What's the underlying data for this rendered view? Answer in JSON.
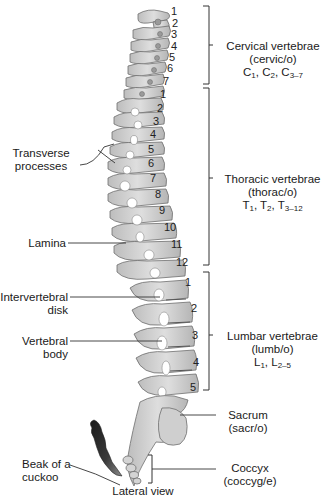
{
  "diagram": {
    "type": "anatomical-illustration",
    "caption": "Lateral view",
    "colors": {
      "bone_fill": "#c9c9c9",
      "bone_light": "#dcdcdc",
      "bone_stroke": "#6e6e6e",
      "line": "#333333",
      "beak": "#2a2a2a"
    },
    "regions": [
      {
        "id": "cervical",
        "name": "Cervical vertebrae",
        "combining_form": "(cervic/o)",
        "notation_prefix": "C",
        "notation": [
          {
            "base": "C",
            "sub": "1"
          },
          {
            "base": "C",
            "sub": "2"
          },
          {
            "base": "C",
            "sub": "3–7"
          }
        ],
        "numbers": [
          "1",
          "2",
          "3",
          "4",
          "5",
          "6",
          "7"
        ]
      },
      {
        "id": "thoracic",
        "name": "Thoracic vertebrae",
        "combining_form": "(thorac/o)",
        "notation": [
          {
            "base": "T",
            "sub": "1"
          },
          {
            "base": "T",
            "sub": "2"
          },
          {
            "base": "T",
            "sub": "3–12"
          }
        ],
        "numbers": [
          "1",
          "2",
          "3",
          "4",
          "5",
          "6",
          "7",
          "8",
          "9",
          "10",
          "11",
          "12"
        ]
      },
      {
        "id": "lumbar",
        "name": "Lumbar vertebrae",
        "combining_form": "(lumb/o)",
        "notation": [
          {
            "base": "L",
            "sub": "1"
          },
          {
            "base": "L",
            "sub": "2–5"
          }
        ],
        "numbers": [
          "1",
          "2",
          "3",
          "4",
          "5"
        ]
      },
      {
        "id": "sacrum",
        "name": "Sacrum",
        "combining_form": "(sacr/o)"
      },
      {
        "id": "coccyx",
        "name": "Coccyx",
        "combining_form": "(coccyg/e)"
      }
    ],
    "left_labels": [
      {
        "id": "transverse-processes",
        "line1": "Transverse",
        "line2": "processes"
      },
      {
        "id": "lamina",
        "line1": "Lamina"
      },
      {
        "id": "intervertebral-disk",
        "line1": "Intervertebral",
        "line2": "disk"
      },
      {
        "id": "vertebral-body",
        "line1": "Vertebral",
        "line2": "body"
      },
      {
        "id": "beak-of-cuckoo",
        "line1": "Beak of a",
        "line2": "cuckoo"
      }
    ]
  }
}
